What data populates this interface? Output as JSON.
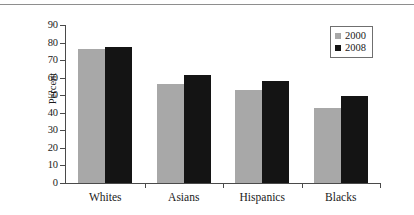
{
  "chart_data": {
    "type": "bar",
    "title": "",
    "xlabel": "",
    "ylabel": "Percent",
    "ylim": [
      0,
      90
    ],
    "ytick_step": 10,
    "yticks": [
      "90",
      "80",
      "70",
      "60",
      "50",
      "40",
      "30",
      "20",
      "10",
      "0"
    ],
    "grid": false,
    "legend_position": "top-right",
    "categories": [
      "Whites",
      "Asians",
      "Hispanics",
      "Blacks"
    ],
    "series": [
      {
        "name": "2000",
        "color": "#a8a8a8",
        "values": [
          76.5,
          56.5,
          53,
          42.5
        ]
      },
      {
        "name": "2008",
        "color": "#141414",
        "values": [
          77.5,
          61.5,
          58,
          49.5
        ]
      }
    ]
  },
  "legend": {
    "items": [
      {
        "label": "2000",
        "swatch": "legend-swatch-2000"
      },
      {
        "label": "2008",
        "swatch": "legend-swatch-2008"
      }
    ]
  }
}
